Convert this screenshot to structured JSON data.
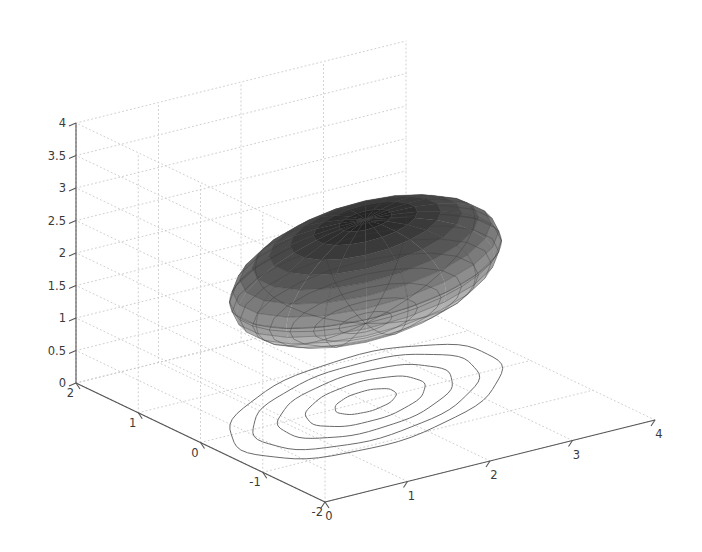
{
  "figure": {
    "kind": "matlab-3d-surface-with-contour",
    "background_color": "#ffffff",
    "axis_color": "#555555",
    "grid_color": "#c8c8c8",
    "contour_color": "#6b6b6b",
    "mesh_color": "#3c3c3c",
    "title": "",
    "xlabel": "",
    "ylabel": "",
    "zlabel": ""
  },
  "chart_data": {
    "type": "surface",
    "title": "",
    "xlabel": "",
    "ylabel": "",
    "zlabel": "",
    "grid": true,
    "legend": "none",
    "x_axis": {
      "name": "x-axis",
      "ticks": [
        0,
        1,
        2,
        3,
        4
      ],
      "tick_labels": [
        "0",
        "1",
        "2",
        "3",
        "4"
      ],
      "range": [
        0,
        4
      ]
    },
    "y_axis": {
      "name": "y-axis",
      "ticks": [
        2,
        1,
        0,
        -1,
        -2
      ],
      "tick_labels": [
        "2",
        "1",
        "0",
        "-1",
        "-2"
      ],
      "range": [
        -2,
        2
      ]
    },
    "z_axis": {
      "name": "z-axis",
      "ticks": [
        0,
        0.5,
        1,
        1.5,
        2,
        2.5,
        3,
        3.5,
        4
      ],
      "tick_labels": [
        "0",
        "0.5",
        "1",
        "1.5",
        "2",
        "2.5",
        "3",
        "3.5",
        "4"
      ],
      "range": [
        0,
        4
      ]
    },
    "surface": {
      "shape": "ellipsoid",
      "center": [
        2.0,
        0.0,
        2.0
      ],
      "radii": [
        1.85,
        0.95,
        0.8
      ],
      "rotation_deg_about_z": 18,
      "shading": "gray-banded-lighting",
      "mesh_u_count": 20,
      "mesh_v_count": 16,
      "colormap": "gray",
      "band_colors": [
        "#242424",
        "#2e2e2e",
        "#3a3a3a",
        "#484848",
        "#565656",
        "#686868",
        "#7b7b7b",
        "#8d8d8d",
        "#9e9e9e",
        "#b0b0b0",
        "#c0c0c0",
        "#cdcdcd",
        "#d8d8d8",
        "#e1e1e1",
        "#e8e8e8",
        "#eeeeee"
      ]
    },
    "contour": {
      "plane_z": 0,
      "levels": [
        1.25,
        1.55,
        1.85,
        2.15,
        2.45
      ],
      "level_count": 5,
      "center": [
        2.0,
        0.0
      ],
      "rotation_deg": 18,
      "semi_axes_x": [
        1.85,
        1.55,
        1.2,
        0.82,
        0.42
      ],
      "semi_axes_y": [
        0.95,
        0.78,
        0.6,
        0.41,
        0.21
      ]
    }
  },
  "axis_labels": {
    "z": [
      "4",
      "3.5",
      "3",
      "2.5",
      "2",
      "1.5",
      "1",
      "0.5",
      "0"
    ],
    "y": [
      "2",
      "1",
      "0",
      "-1",
      "-2"
    ],
    "x": [
      "0",
      "1",
      "2",
      "3",
      "4"
    ]
  }
}
